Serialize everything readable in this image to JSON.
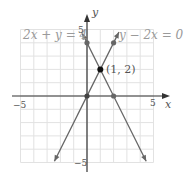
{
  "chart_data": {
    "type": "line",
    "title": "",
    "xlabel": "x",
    "ylabel": "y",
    "xlim": [
      -5,
      5
    ],
    "ylim": [
      -5,
      5
    ],
    "grid": true,
    "x_tick_labels": [
      "-5",
      "5"
    ],
    "y_tick_labels": [
      "5",
      "-5"
    ],
    "series": [
      {
        "name": "2x + y = 4",
        "equation": "y = -2x + 4",
        "slope": -2,
        "intercept": 4,
        "points": [
          [
            0,
            4
          ],
          [
            2,
            0
          ]
        ]
      },
      {
        "name": "y - 2x = 0",
        "equation": "y = 2x",
        "slope": 2,
        "intercept": 0,
        "points": [
          [
            0,
            0
          ],
          [
            2,
            4
          ]
        ]
      }
    ],
    "annotations": [
      {
        "text": "(1, 2)",
        "x": 1,
        "y": 2,
        "type": "intersection"
      }
    ]
  },
  "labels": {
    "eq1": "2x + y = 4",
    "eq2": "y − 2x = 0",
    "intersection": "(1, 2)",
    "xaxis": "x",
    "yaxis": "y",
    "xmin": "−5",
    "xmax": "5",
    "ymax": "5",
    "ymin": "−5"
  },
  "colors": {
    "line": "#666666",
    "grid": "#e2e2e2",
    "axis": "#333333",
    "point": "#111111"
  }
}
